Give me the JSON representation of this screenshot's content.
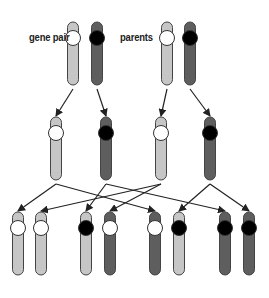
{
  "labels": {
    "gene_pair": "gene pair",
    "parents": "parents"
  },
  "colors": {
    "light_chromosome": "#c6c6c6",
    "dark_chromosome": "#5e5e5e",
    "outline": "#444444",
    "white_allele": "#ffffff",
    "black_allele": "#000000",
    "arrow": "#222222"
  },
  "rows": {
    "parents": [
      {
        "x": 73,
        "body": "light",
        "allele": "white"
      },
      {
        "x": 97,
        "body": "dark",
        "allele": "black"
      },
      {
        "x": 167,
        "body": "light",
        "allele": "white"
      },
      {
        "x": 190,
        "body": "dark",
        "allele": "black"
      }
    ],
    "gametes": [
      {
        "x": 56,
        "body": "light",
        "allele": "white"
      },
      {
        "x": 106,
        "body": "dark",
        "allele": "black"
      },
      {
        "x": 161,
        "body": "light",
        "allele": "white"
      },
      {
        "x": 210,
        "body": "dark",
        "allele": "black"
      }
    ],
    "offspring": [
      {
        "x": 18,
        "body": "light",
        "allele": "white"
      },
      {
        "x": 41,
        "body": "light",
        "allele": "white"
      },
      {
        "x": 86,
        "body": "light",
        "allele": "black"
      },
      {
        "x": 110,
        "body": "dark",
        "allele": "white"
      },
      {
        "x": 155,
        "body": "dark",
        "allele": "white"
      },
      {
        "x": 179,
        "body": "light",
        "allele": "black"
      },
      {
        "x": 225,
        "body": "dark",
        "allele": "black"
      },
      {
        "x": 249,
        "body": "dark",
        "allele": "black"
      }
    ]
  },
  "arrows": {
    "parents_to_gametes": [
      [
        0,
        0
      ],
      [
        1,
        1
      ],
      [
        2,
        2
      ],
      [
        3,
        3
      ]
    ],
    "gametes_to_offspring": [
      [
        0,
        0
      ],
      [
        0,
        4
      ],
      [
        1,
        2
      ],
      [
        1,
        6
      ],
      [
        2,
        1
      ],
      [
        2,
        3
      ],
      [
        3,
        5
      ],
      [
        3,
        7
      ]
    ]
  }
}
